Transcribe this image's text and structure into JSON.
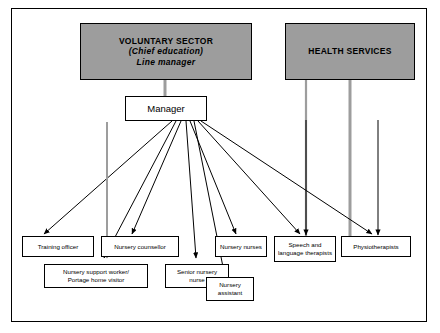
{
  "diagram": {
    "type": "organisational-chart",
    "frame": {
      "border_color": "#000000",
      "background": "#ffffff"
    },
    "header_fill": "#9d9d9d",
    "box_fill": "#ffffff",
    "line_color": "#000000",
    "grey_line_color": "#9d9d9d"
  },
  "headers": {
    "voluntary_sector": {
      "line1": "VOLUNTARY SECTOR",
      "line2": "(Chief education)",
      "line3": "Line manager"
    },
    "health_services": {
      "line1": "HEALTH SERVICES"
    }
  },
  "manager": {
    "label": "Manager"
  },
  "roles_row1": [
    {
      "label": "Training officer"
    },
    {
      "label": "Nursery counsellor"
    },
    {
      "label": "Nursery nurses"
    },
    {
      "label": "Speech and language therapists"
    },
    {
      "label": "Physiotherapists"
    }
  ],
  "roles_row2": [
    {
      "line1": "Nursery support worker/",
      "line2": "Portage home visitor"
    },
    {
      "line1": "Senior nursery",
      "line2": "nurse"
    },
    {
      "line1": "Nursery",
      "line2": "assistant"
    }
  ]
}
